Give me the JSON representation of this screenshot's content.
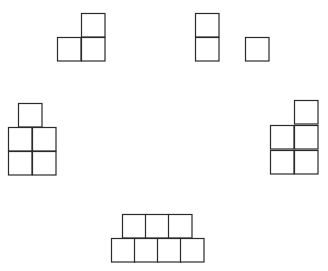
{
  "diagram": {
    "background": "#ffffff",
    "stroke_color": "#2a2a2a",
    "cell_size": 23.5,
    "shapes": [
      {
        "name": "shape-l-tromino",
        "cells": [
          [
            81,
            13
          ],
          [
            57,
            37
          ],
          [
            81,
            37
          ]
        ]
      },
      {
        "name": "shape-vertical-domino",
        "cells": [
          [
            195,
            13
          ],
          [
            195,
            37
          ]
        ]
      },
      {
        "name": "shape-monomino",
        "cells": [
          [
            245,
            37
          ]
        ]
      },
      {
        "name": "shape-pentomino-left",
        "cells": [
          [
            18,
            103
          ],
          [
            8,
            127
          ],
          [
            32,
            127
          ],
          [
            8,
            151
          ],
          [
            32,
            151
          ]
        ]
      },
      {
        "name": "shape-pentomino-right",
        "cells": [
          [
            294,
            100
          ],
          [
            270,
            125
          ],
          [
            294,
            125
          ],
          [
            270,
            150
          ],
          [
            294,
            150
          ]
        ]
      },
      {
        "name": "shape-heptomino-bottom",
        "cells": [
          [
            122,
            214
          ],
          [
            145,
            214
          ],
          [
            168,
            214
          ],
          [
            111,
            238
          ],
          [
            134,
            238
          ],
          [
            157,
            238
          ],
          [
            180,
            238
          ]
        ]
      }
    ]
  }
}
